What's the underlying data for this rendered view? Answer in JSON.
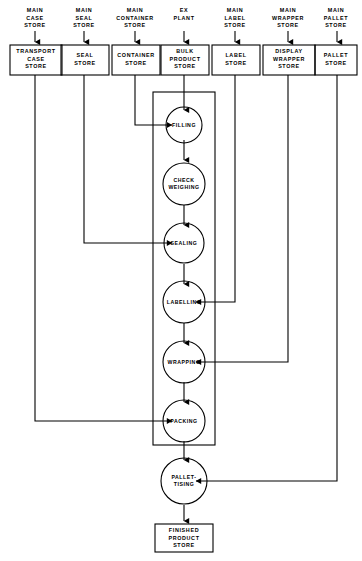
{
  "diagram": {
    "type": "process-flowchart",
    "stroke_color": "#000000",
    "background_color": "#ffffff"
  },
  "source_labels": [
    {
      "id": "main-case-store",
      "text": "MAIN\nCASE\nSTORE"
    },
    {
      "id": "main-seal-store",
      "text": "MAIN\nSEAL\nSTORE"
    },
    {
      "id": "main-container-store",
      "text": "MAIN\nCONTAINER\nSTORE"
    },
    {
      "id": "ex-plant",
      "text": "EX\nPLANT"
    },
    {
      "id": "main-label-store",
      "text": "MAIN\nLABEL\nSTORE"
    },
    {
      "id": "main-wrapper-store",
      "text": "MAIN\nWRAPPER\nSTORE"
    },
    {
      "id": "main-pallet-store",
      "text": "MAIN\nPALLET\nSTORE"
    }
  ],
  "store_boxes": [
    {
      "id": "transport-case-store",
      "text": "TRANSPORT\nCASE\nSTORE"
    },
    {
      "id": "seal-store",
      "text": "SEAL\nSTORE"
    },
    {
      "id": "container-store",
      "text": "CONTAINER\nSTORE"
    },
    {
      "id": "bulk-product-store",
      "text": "BULK\nPRODUCT\nSTORE"
    },
    {
      "id": "label-store",
      "text": "LABEL\nSTORE"
    },
    {
      "id": "display-wrapper-store",
      "text": "DISPLAY\nWRAPPER\nSTORE"
    },
    {
      "id": "pallet-store",
      "text": "PALLET\nSTORE"
    }
  ],
  "process_nodes": [
    {
      "id": "filling",
      "text": "FILLING"
    },
    {
      "id": "check-weighing",
      "text": "CHECK\nWEIGHING"
    },
    {
      "id": "sealing",
      "text": "SEALING"
    },
    {
      "id": "labelling",
      "text": "LABELLING"
    },
    {
      "id": "wrapping",
      "text": "WRAPPING"
    },
    {
      "id": "packing",
      "text": "PACKING"
    },
    {
      "id": "palletising",
      "text": "PALLET-\nTISING"
    }
  ],
  "output_box": {
    "id": "finished-product-store",
    "text": "FINISHED\nPRODUCT\nSTORE"
  }
}
